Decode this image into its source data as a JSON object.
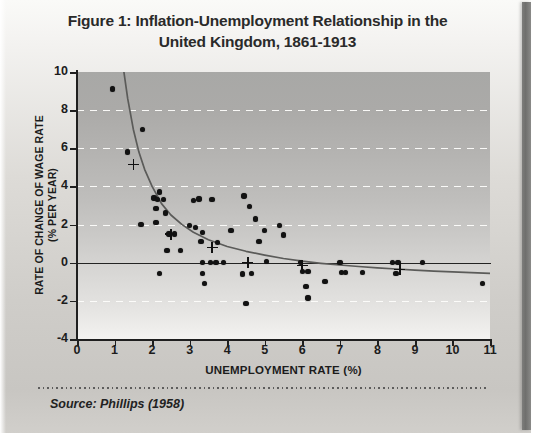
{
  "figure": {
    "title_line1": "Figure 1: Inflation-Unemployment Relationship in the",
    "title_line2": "United Kingdom, 1861-1913",
    "source": "Source: Phillips (1958)"
  },
  "colors": {
    "ink": "#1c1c1c",
    "point": "#121212",
    "curve": "#5b5b59",
    "gridline": "#fdfdfb",
    "plot_top": "#a8a8a6",
    "plot_bottom": "#f4f3f1",
    "page": "#d8d6d2",
    "spine": "#6f6f6d"
  },
  "chart_data": {
    "type": "scatter",
    "title": "Figure 1: Inflation-Unemployment Relationship in the United Kingdom, 1861-1913",
    "xlabel": "UNEMPLOYMENT RATE (%)",
    "ylabel": "RATE OF CHANGE OF WAGE RATE (% PER YEAR)",
    "ylabel_line1": "RATE OF CHANGE OF WAGE RATE",
    "ylabel_line2": "(% PER YEAR)",
    "xlim": [
      0,
      11
    ],
    "ylim": [
      -4,
      10
    ],
    "xticks": [
      0,
      1,
      2,
      3,
      4,
      5,
      6,
      7,
      8,
      9,
      10,
      11
    ],
    "yticks": [
      -4,
      -2,
      0,
      2,
      4,
      6,
      8,
      10
    ],
    "gridlines_y": [
      -2,
      2,
      4,
      6,
      8
    ],
    "grid": "horizontal-dashed-white",
    "zero_line_y": 0,
    "legend": "none",
    "source": "Source: Phillips (1958)",
    "series": [
      {
        "name": "Observations",
        "marker": "filled-circle",
        "points": [
          [
            0.95,
            9.1
          ],
          [
            1.35,
            5.8
          ],
          [
            1.75,
            7.0
          ],
          [
            2.05,
            3.4
          ],
          [
            2.15,
            3.3
          ],
          [
            2.2,
            3.7
          ],
          [
            2.3,
            3.3
          ],
          [
            2.35,
            2.6
          ],
          [
            2.1,
            2.1
          ],
          [
            2.1,
            2.85
          ],
          [
            1.7,
            2.0
          ],
          [
            2.45,
            1.5
          ],
          [
            2.6,
            1.5
          ],
          [
            2.4,
            0.65
          ],
          [
            2.75,
            0.65
          ],
          [
            2.2,
            -0.55
          ],
          [
            3.0,
            1.95
          ],
          [
            3.15,
            1.85
          ],
          [
            3.1,
            3.25
          ],
          [
            3.25,
            3.35
          ],
          [
            3.35,
            1.6
          ],
          [
            3.3,
            1.1
          ],
          [
            3.35,
            0.0
          ],
          [
            3.55,
            0.0
          ],
          [
            3.7,
            0.0
          ],
          [
            3.9,
            0.0
          ],
          [
            3.35,
            -0.55
          ],
          [
            3.4,
            -1.1
          ],
          [
            3.6,
            3.3
          ],
          [
            3.75,
            1.05
          ],
          [
            4.1,
            1.7
          ],
          [
            4.45,
            3.5
          ],
          [
            4.4,
            -0.6
          ],
          [
            4.5,
            -2.15
          ],
          [
            4.6,
            2.95
          ],
          [
            4.75,
            2.3
          ],
          [
            5.0,
            1.7
          ],
          [
            4.85,
            1.1
          ],
          [
            5.05,
            0.05
          ],
          [
            4.65,
            -0.55
          ],
          [
            5.4,
            1.95
          ],
          [
            5.5,
            1.45
          ],
          [
            5.95,
            0.0
          ],
          [
            6.0,
            -0.45
          ],
          [
            6.15,
            -0.45
          ],
          [
            6.1,
            -1.25
          ],
          [
            6.15,
            -1.85
          ],
          [
            6.6,
            -1.0
          ],
          [
            7.0,
            0.0
          ],
          [
            7.05,
            -0.5
          ],
          [
            7.15,
            -0.5
          ],
          [
            7.6,
            -0.5
          ],
          [
            8.4,
            0.0
          ],
          [
            8.55,
            0.0
          ],
          [
            8.5,
            -0.55
          ],
          [
            9.2,
            0.0
          ],
          [
            10.8,
            -1.1
          ]
        ]
      },
      {
        "name": "Group means",
        "marker": "cross",
        "points": [
          [
            1.5,
            5.15
          ],
          [
            2.5,
            1.5
          ],
          [
            3.6,
            0.8
          ],
          [
            4.55,
            0.0
          ],
          [
            6.0,
            -0.15
          ],
          [
            8.6,
            -0.35
          ]
        ]
      }
    ],
    "fitted_curve": {
      "name": "Phillips curve",
      "style": "solid-thin-gray",
      "points": [
        [
          1.25,
          10.0
        ],
        [
          1.35,
          8.6
        ],
        [
          1.5,
          7.0
        ],
        [
          1.65,
          5.8
        ],
        [
          1.8,
          4.9
        ],
        [
          2.0,
          4.0
        ],
        [
          2.25,
          3.1
        ],
        [
          2.5,
          2.5
        ],
        [
          2.8,
          2.0
        ],
        [
          3.1,
          1.6
        ],
        [
          3.5,
          1.2
        ],
        [
          4.0,
          0.85
        ],
        [
          4.5,
          0.6
        ],
        [
          5.0,
          0.4
        ],
        [
          5.5,
          0.22
        ],
        [
          6.0,
          0.08
        ],
        [
          6.5,
          -0.03
        ],
        [
          7.0,
          -0.12
        ],
        [
          7.5,
          -0.2
        ],
        [
          8.0,
          -0.27
        ],
        [
          8.5,
          -0.33
        ],
        [
          9.0,
          -0.39
        ],
        [
          9.5,
          -0.44
        ],
        [
          10.0,
          -0.48
        ],
        [
          10.5,
          -0.52
        ],
        [
          11.0,
          -0.56
        ]
      ]
    }
  }
}
